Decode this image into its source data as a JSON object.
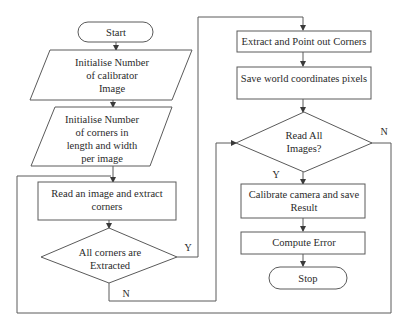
{
  "diagram": {
    "type": "flowchart",
    "nodes": {
      "start": {
        "shape": "terminal",
        "label": "Start"
      },
      "init_images": {
        "shape": "parallelogram",
        "lines": [
          "Initialise Number",
          "of calibrator",
          "Image"
        ]
      },
      "init_corners": {
        "shape": "parallelogram",
        "lines": [
          "Initialise Number",
          "of corners in",
          "length and width",
          "per image"
        ]
      },
      "read_image": {
        "shape": "process",
        "lines": [
          "Read an image and extract",
          "corners"
        ]
      },
      "all_corners": {
        "shape": "decision",
        "lines": [
          "All corners are",
          "Extracted"
        ]
      },
      "extract_points": {
        "shape": "process",
        "label": "Extract and Point out Corners"
      },
      "save_world": {
        "shape": "process",
        "label": "Save world coordinates pixels"
      },
      "read_all": {
        "shape": "decision",
        "lines": [
          "Read All",
          "Images?"
        ]
      },
      "calibrate": {
        "shape": "process",
        "lines": [
          "Calibrate camera and save",
          "Result"
        ]
      },
      "compute_error": {
        "shape": "process",
        "label": "Compute Error"
      },
      "stop": {
        "shape": "terminal",
        "label": "Stop"
      }
    },
    "edge_labels": {
      "all_corners_yes": "Y",
      "all_corners_no": "N",
      "read_all_yes": "Y",
      "read_all_no": "N"
    },
    "colors": {
      "stroke": "#5a5a5a",
      "text": "#2a2a2a",
      "background": "#ffffff"
    }
  }
}
